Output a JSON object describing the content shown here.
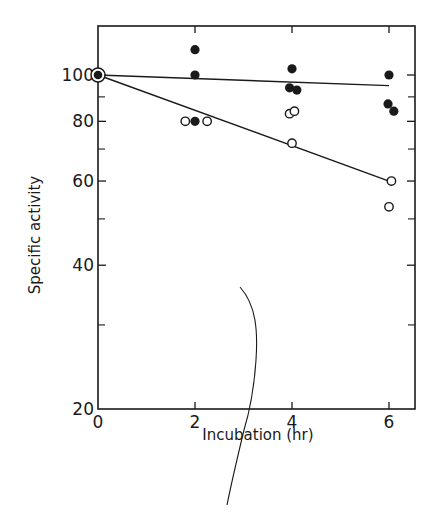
{
  "chart_data": {
    "type": "scatter",
    "title": "",
    "xlabel": "Incubation (hr)",
    "ylabel": "Specific activity",
    "yscale": "log",
    "xlim": [
      0,
      6.5
    ],
    "ylim": [
      20,
      125
    ],
    "x_ticks": [
      0,
      2,
      4,
      6
    ],
    "x_tick_labels": [
      "0",
      "2",
      "4",
      "6"
    ],
    "y_ticks_labeled": [
      20,
      40,
      60,
      80,
      100
    ],
    "y_tick_labels": [
      "20",
      "40",
      "60",
      "80",
      "100"
    ],
    "y_ticks_minor": [
      30,
      50,
      70,
      90
    ],
    "grid": false,
    "legend": null,
    "series": [
      {
        "name": "filled circles",
        "marker": "filled-circle",
        "points": [
          {
            "x": 0,
            "y": 100
          },
          {
            "x": 2,
            "y": 113
          },
          {
            "x": 2,
            "y": 100
          },
          {
            "x": 2,
            "y": 80
          },
          {
            "x": 4,
            "y": 103
          },
          {
            "x": 3.95,
            "y": 94
          },
          {
            "x": 4.1,
            "y": 93
          },
          {
            "x": 6,
            "y": 100
          },
          {
            "x": 5.98,
            "y": 87
          },
          {
            "x": 6.1,
            "y": 84
          }
        ],
        "fit_line": {
          "x": [
            0,
            6
          ],
          "y": [
            100,
            95
          ]
        }
      },
      {
        "name": "open circles",
        "marker": "open-circle",
        "points": [
          {
            "x": 0,
            "y": 100
          },
          {
            "x": 1.8,
            "y": 80
          },
          {
            "x": 2.25,
            "y": 80
          },
          {
            "x": 3.95,
            "y": 83
          },
          {
            "x": 4.05,
            "y": 84
          },
          {
            "x": 4.0,
            "y": 72
          },
          {
            "x": 6.05,
            "y": 60
          },
          {
            "x": 6.0,
            "y": 53
          }
        ],
        "fit_line": {
          "x": [
            0,
            6
          ],
          "y": [
            100,
            60
          ]
        }
      }
    ],
    "annotations": []
  },
  "colors": {
    "ink": "#1a1a1a",
    "background": "#ffffff"
  }
}
